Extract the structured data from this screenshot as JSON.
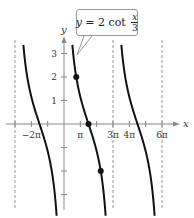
{
  "chart_data": {
    "type": "line",
    "title": "",
    "function_label": {
      "lhs": "y",
      "eq": " = 2 cot ",
      "frac_num": "x",
      "frac_den": "3"
    },
    "function": "y = 2 cot(x/3)",
    "xlabel": "x",
    "ylabel": "y",
    "xlim_pi": [
      -3.1,
      6.6
    ],
    "ylim": [
      -4,
      3.6
    ],
    "x_tick_labels": [
      {
        "label": "−2π",
        "value_pi": -2
      },
      {
        "label": "π",
        "value_pi": 1
      },
      {
        "label": "3π",
        "value_pi": 3
      },
      {
        "label": "4π",
        "value_pi": 4
      },
      {
        "label": "6π",
        "value_pi": 6
      }
    ],
    "x_ticks_pi": [
      -3,
      -2,
      -1,
      1,
      2,
      3,
      4,
      5,
      6
    ],
    "y_tick_labels": [
      {
        "label": "1",
        "value": 1
      },
      {
        "label": "2",
        "value": 2
      },
      {
        "label": "3",
        "value": 3
      }
    ],
    "y_ticks": [
      -3,
      -2,
      -1,
      1,
      2,
      3
    ],
    "asymptotes_pi": [
      -3,
      0,
      3,
      6
    ],
    "period_pi": 3,
    "highlighted_points": [
      {
        "x_pi": 0.75,
        "y": 2
      },
      {
        "x_pi": 1.5,
        "y": 0
      },
      {
        "x_pi": 2.25,
        "y": -2
      }
    ],
    "grid": false,
    "legend": "callout box"
  },
  "colors": {
    "curve": "#111111",
    "axis": "#888888",
    "asymptote": "#999999",
    "callout_border": "#9a9a9a"
  }
}
